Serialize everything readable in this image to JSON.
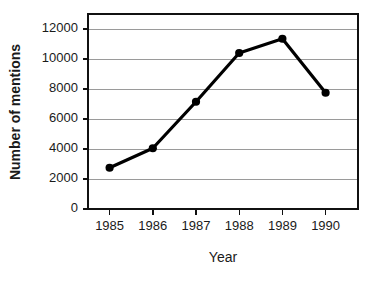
{
  "chart_data": {
    "type": "line",
    "title": "",
    "xlabel": "Year",
    "ylabel": "Number of mentions",
    "categories": [
      "1985",
      "1986",
      "1987",
      "1988",
      "1989",
      "1990"
    ],
    "x": [
      1985,
      1986,
      1987,
      1988,
      1989,
      1990
    ],
    "values": [
      2750,
      4050,
      7150,
      10400,
      11350,
      7750
    ],
    "series": [
      {
        "name": "Number of mentions",
        "values": [
          2750,
          4050,
          7150,
          10400,
          11350,
          7750
        ]
      }
    ],
    "ylim": [
      0,
      13000
    ],
    "xlim": [
      1984.5,
      1990.75
    ],
    "yticks": [
      0,
      2000,
      4000,
      6000,
      8000,
      10000,
      12000
    ],
    "ytick_labels": [
      "0",
      "2000",
      "4000",
      "6000",
      "8000",
      "10000",
      "12000"
    ],
    "xticks": [
      1985,
      1986,
      1987,
      1988,
      1989,
      1990
    ],
    "xtick_labels": [
      "1985",
      "1986",
      "1987",
      "1988",
      "1989",
      "1990"
    ],
    "grid": "horizontal",
    "legend": "none",
    "marker": "filled-circle",
    "line_color": "#000000",
    "marker_color": "#000000",
    "grid_color": "#9a9a9a",
    "frame_color": "#111111",
    "background_color": "#ffffff"
  },
  "layout": {
    "plot_left": 88,
    "plot_top": 14,
    "plot_right": 358,
    "plot_bottom": 209,
    "xlabel_x": 223,
    "xlabel_y": 262,
    "ylabel_x": 20,
    "ylabel_y": 112
  }
}
